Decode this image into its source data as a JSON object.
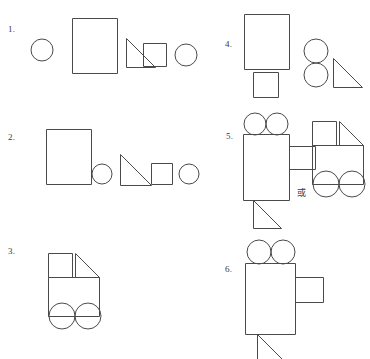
{
  "page": {
    "background_color": "#ffffff",
    "stroke_color": "#4a4a4a",
    "width": 370,
    "height": 348,
    "columns": 2,
    "rows": 3
  },
  "labels": {
    "item1": "1.",
    "item2": "2.",
    "item3": "3.",
    "item4": "4.",
    "item5": "5.",
    "item6": "6.",
    "or": "或"
  },
  "items": [
    {
      "number": "1.",
      "kind": "shape-inventory",
      "shapes": [
        {
          "name": "circle",
          "label": "circle",
          "w": 22,
          "h": 22
        },
        {
          "name": "rectangle",
          "label": "rectangle",
          "w": 44,
          "h": 54
        },
        {
          "name": "right-triangle",
          "label": "right triangle",
          "w": 28,
          "h": 28,
          "right_angle": "bottom-left"
        },
        {
          "name": "square",
          "label": "square",
          "w": 22,
          "h": 22
        },
        {
          "name": "circle",
          "label": "circle",
          "w": 22,
          "h": 22
        }
      ]
    },
    {
      "number": "2.",
      "kind": "shape-inventory",
      "shapes": [
        {
          "name": "rectangle",
          "label": "rectangle",
          "w": 44,
          "h": 54
        },
        {
          "name": "circle",
          "label": "circle",
          "w": 20,
          "h": 20
        },
        {
          "name": "right-triangle",
          "label": "right triangle",
          "w": 30,
          "h": 30,
          "right_angle": "bottom-left"
        },
        {
          "name": "square",
          "label": "square",
          "w": 20,
          "h": 20
        },
        {
          "name": "circle",
          "label": "circle",
          "w": 20,
          "h": 20
        }
      ]
    },
    {
      "number": "3.",
      "kind": "assembled-figure",
      "figure": "truck",
      "parts": [
        "square-cab",
        "right-triangle-roof",
        "rectangle-body",
        "circle-wheel",
        "circle-wheel"
      ]
    },
    {
      "number": "4.",
      "kind": "shape-inventory",
      "shapes": [
        {
          "name": "rectangle",
          "label": "rectangle",
          "w": 44,
          "h": 54
        },
        {
          "name": "square",
          "label": "square",
          "w": 24,
          "h": 24
        },
        {
          "name": "circle",
          "label": "circle",
          "w": 24,
          "h": 24
        },
        {
          "name": "circle",
          "label": "circle",
          "w": 24,
          "h": 24
        },
        {
          "name": "right-triangle",
          "label": "right triangle",
          "w": 28,
          "h": 28,
          "right_angle": "bottom-left"
        }
      ]
    },
    {
      "number": "5.",
      "kind": "assembled-figure-pair",
      "separator": "或",
      "figures": [
        {
          "figure": "camera",
          "parts": [
            "circle-lens",
            "circle-lens",
            "rectangle-body",
            "rectangle-lens-barrel",
            "right-triangle-stand"
          ]
        },
        {
          "figure": "truck",
          "parts": [
            "square-cab",
            "right-triangle-roof",
            "rectangle-body",
            "circle-wheel",
            "circle-wheel"
          ]
        }
      ]
    },
    {
      "number": "6.",
      "kind": "assembled-figure",
      "figure": "camera",
      "parts": [
        "circle-lens",
        "circle-lens",
        "rectangle-body",
        "rectangle-lens-barrel",
        "right-triangle-stand"
      ]
    }
  ]
}
